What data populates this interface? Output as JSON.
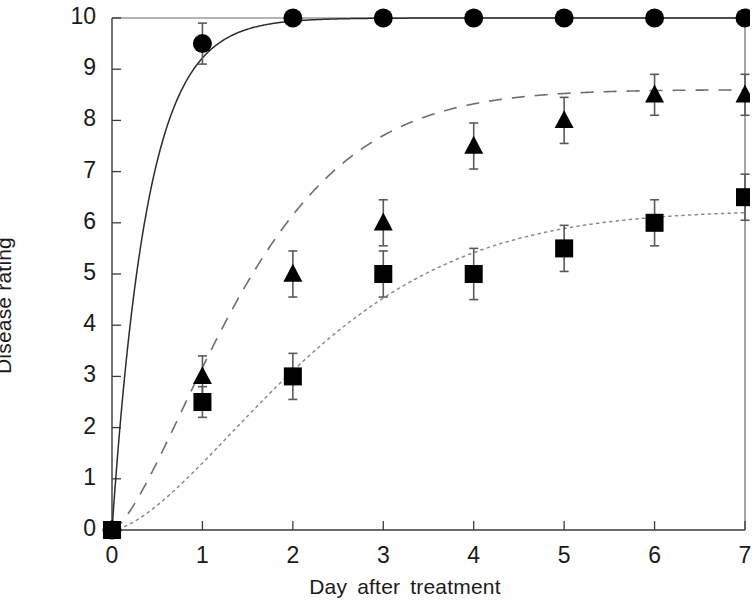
{
  "chart_data": {
    "type": "line",
    "title": "",
    "subtitle": "",
    "xlabel": "Day  after  treatment",
    "ylabel": "Disease  rating",
    "xlim": [
      0,
      7
    ],
    "ylim": [
      0,
      10
    ],
    "xticks": [
      0,
      1,
      2,
      3,
      4,
      5,
      6,
      7
    ],
    "xtick_labels": [
      "0",
      "1",
      "2",
      "3",
      "4",
      "5",
      "6",
      "7"
    ],
    "yticks": [
      0,
      1,
      2,
      3,
      4,
      5,
      6,
      7,
      8,
      9,
      10
    ],
    "ytick_labels": [
      "0",
      "1",
      "2",
      "3",
      "4",
      "5",
      "6",
      "7",
      "8",
      "9",
      "10"
    ],
    "grid": false,
    "legend": "none",
    "x": [
      0,
      1,
      2,
      3,
      4,
      5,
      6,
      7
    ],
    "series": [
      {
        "name": "Untreated control",
        "marker": "circle",
        "line_style": "solid",
        "color": "#000000",
        "values": [
          0,
          9.5,
          10,
          10,
          10,
          10,
          10,
          10
        ],
        "errors": [
          0,
          0.4,
          0,
          0,
          0,
          0,
          0,
          0
        ]
      },
      {
        "name": "Treatment A",
        "marker": "triangle",
        "line_style": "dashed",
        "color": "#000000",
        "values": [
          0,
          3.0,
          5.0,
          6.0,
          7.5,
          8.0,
          8.5,
          8.5
        ],
        "errors": [
          0,
          0.4,
          0.45,
          0.45,
          0.45,
          0.45,
          0.4,
          0.4
        ]
      },
      {
        "name": "Treatment B",
        "marker": "square",
        "line_style": "dotted",
        "color": "#000000",
        "values": [
          0,
          2.5,
          3.0,
          5.0,
          5.0,
          5.5,
          6.0,
          6.5
        ],
        "errors": [
          0,
          0.3,
          0.45,
          0.45,
          0.5,
          0.45,
          0.45,
          0.45
        ]
      }
    ],
    "fitted_curves": [
      {
        "name": "solid-fit",
        "line_style": "solid",
        "asymptote": 10,
        "note": "steep rise reaching plateau of 10 shortly after day 1"
      },
      {
        "name": "dashed-fit",
        "line_style": "dashed",
        "asymptote": 8.6,
        "note": "sigmoidal rise plateauing near 8.6 by day 6"
      },
      {
        "name": "dotted-fit",
        "line_style": "dotted",
        "asymptote": 6.25,
        "note": "slower rise plateauing near 6.25 by day 7"
      }
    ]
  },
  "axes": {
    "y_title": "Disease  rating",
    "x_title": "Day  after  treatment"
  }
}
